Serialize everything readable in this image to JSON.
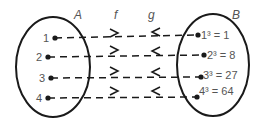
{
  "diagram": {
    "set_a": {
      "label": "A",
      "elements": [
        "1",
        "2",
        "3",
        "4"
      ]
    },
    "set_b": {
      "label": "B",
      "elements": [
        "1³ = 1",
        "2³ = 8",
        "3³ = 27",
        "4³ = 64"
      ]
    },
    "function_f": {
      "label": "f",
      "direction": "A to B"
    },
    "function_g": {
      "label": "g",
      "direction": "B to A"
    },
    "colors": {
      "stroke": "#1a1a1a",
      "text": "#555555",
      "background": "#ffffff"
    }
  }
}
